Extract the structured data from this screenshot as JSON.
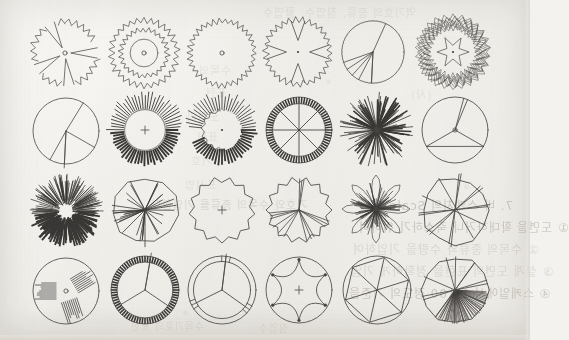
{
  "page": {
    "kind": "scanned-book-page",
    "background_color": "#f1f0ec",
    "ink_color": "#4c4a49",
    "grid": {
      "columns": 6,
      "rows": 4,
      "count": 24
    }
  },
  "bleed_through_text": {
    "note": "faint mirrored show-through from reverse side of the sheet",
    "lines": [
      {
        "text": "역기호의 종류, 침엽수, 활엽수",
        "x": 262,
        "y": 4,
        "size": 11,
        "dim": 3
      },
      {
        "text": "수목의",
        "x": 198,
        "y": 62,
        "size": 11,
        "dim": 3
      },
      {
        "text": "표현",
        "x": 205,
        "y": 84,
        "size": 11,
        "dim": 3
      },
      {
        "text": "(사)",
        "x": 410,
        "y": 86,
        "size": 11,
        "dim": 3
      },
      {
        "text": "도면의",
        "x": 186,
        "y": 108,
        "size": 11,
        "dim": 3
      },
      {
        "text": "표현",
        "x": 196,
        "y": 128,
        "size": 11,
        "dim": 3
      },
      {
        "text": "기호",
        "x": 190,
        "y": 152,
        "size": 11,
        "dim": 3
      },
      {
        "text": "표시법",
        "x": 184,
        "y": 176,
        "size": 11,
        "dim": 3
      },
      {
        "text": "기호와 수목의 종류를 기입한다",
        "x": 150,
        "y": 196,
        "size": 11,
        "dim": 2
      },
      {
        "text": "7. 바 스케치의 Scale",
        "x": 388,
        "y": 196,
        "size": 12,
        "dim": 1
      },
      {
        "text": "① 도면을 확대하거나 축소하기 위하여",
        "x": 358,
        "y": 218,
        "size": 12,
        "dim": 1
      },
      {
        "text": "② 수목의 종류와 수량을 기입하여",
        "x": 352,
        "y": 240,
        "size": 12,
        "dim": 2
      },
      {
        "text": "③ 설계 도면의 표현을 정확하게 기입",
        "x": 350,
        "y": 262,
        "size": 12,
        "dim": 2
      },
      {
        "text": "④ 스케일에서 1/100 정도의 기준을",
        "x": 348,
        "y": 284,
        "size": 12,
        "dim": 1
      },
      {
        "text": "한다.",
        "x": 438,
        "y": 306,
        "size": 12,
        "dim": 2
      },
      {
        "text": "수목기호의 표현",
        "x": 130,
        "y": 318,
        "size": 10,
        "dim": 3
      },
      {
        "text": "침엽수",
        "x": 258,
        "y": 320,
        "size": 10,
        "dim": 3
      }
    ]
  },
  "symbols": [
    {
      "id": "r1c1",
      "name": "spiky-crown-with-radial-gaps",
      "row": 1,
      "col": 1,
      "cx": 65,
      "cy": 53,
      "r": 32,
      "style": "jagged-outline-wedge-cutouts",
      "center_marker": "small-circle"
    },
    {
      "id": "r1c2",
      "name": "double-ring-jagged-crown",
      "row": 1,
      "col": 2,
      "cx": 144,
      "cy": 53,
      "r": 33,
      "style": "double-jagged-ring",
      "center_marker": "small-circle"
    },
    {
      "id": "r1c3",
      "name": "fine-serrated-crown",
      "row": 1,
      "col": 3,
      "cx": 222,
      "cy": 53,
      "r": 32,
      "style": "single-serrated-ring",
      "center_marker": "small-circle"
    },
    {
      "id": "r1c4",
      "name": "lobed-star-crown",
      "row": 1,
      "col": 4,
      "cx": 298,
      "cy": 52,
      "r": 32,
      "style": "jagged-outline-with-notches",
      "center_marker": "dot"
    },
    {
      "id": "r1c5",
      "name": "plain-circle-three-wedges",
      "row": 1,
      "col": 5,
      "cx": 373,
      "cy": 52,
      "r": 31,
      "style": "circle-with-pie-segments",
      "center_marker": "none"
    },
    {
      "id": "r1c6",
      "name": "dense-zigzag-wreath-crown",
      "row": 1,
      "col": 6,
      "cx": 453,
      "cy": 52,
      "r": 35,
      "style": "dense-double-zigzag",
      "center_marker": "dot"
    },
    {
      "id": "r2c1",
      "name": "plain-circle-three-branch",
      "row": 2,
      "col": 1,
      "cx": 66,
      "cy": 131,
      "r": 33,
      "style": "circle-three-radial-lines",
      "center_marker": "none"
    },
    {
      "id": "r2c2",
      "name": "tick-ring-crown-plus",
      "row": 2,
      "col": 2,
      "cx": 145,
      "cy": 130,
      "r": 34,
      "style": "radial-tick-ring",
      "center_marker": "plus"
    },
    {
      "id": "r2c3",
      "name": "broken-tick-ring-crown",
      "row": 2,
      "col": 3,
      "cx": 222,
      "cy": 130,
      "r": 34,
      "style": "broken-radial-tick-ring",
      "center_marker": "dot"
    },
    {
      "id": "r2c4",
      "name": "hatched-wheel-eight-spokes",
      "row": 2,
      "col": 4,
      "cx": 299,
      "cy": 130,
      "r": 33,
      "style": "hatched-rim-wheel",
      "center_marker": "dot"
    },
    {
      "id": "r2c5",
      "name": "radial-burst-starburst",
      "row": 2,
      "col": 5,
      "cx": 377,
      "cy": 130,
      "r": 36,
      "style": "long-needle-burst",
      "center_marker": "dot"
    },
    {
      "id": "r2c6",
      "name": "circle-three-spoke-outline",
      "row": 2,
      "col": 6,
      "cx": 455,
      "cy": 130,
      "r": 33,
      "style": "circle-three-spoke",
      "center_marker": "small-circle"
    },
    {
      "id": "r3c1",
      "name": "fine-needle-burst-crown",
      "row": 3,
      "col": 1,
      "cx": 66,
      "cy": 211,
      "r": 35,
      "style": "fine-needle-burst",
      "center_marker": "none"
    },
    {
      "id": "r3c2",
      "name": "polygon-crown-dense-spokes",
      "row": 3,
      "col": 2,
      "cx": 145,
      "cy": 210,
      "r": 34,
      "style": "polygon-with-radial-spokes",
      "center_marker": "dot"
    },
    {
      "id": "r3c3",
      "name": "scalloped-polygon-plus",
      "row": 3,
      "col": 3,
      "cx": 222,
      "cy": 210,
      "r": 33,
      "style": "scalloped-outline",
      "center_marker": "plus"
    },
    {
      "id": "r3c4",
      "name": "scalloped-crown-wedge-gaps",
      "row": 3,
      "col": 4,
      "cx": 299,
      "cy": 210,
      "r": 33,
      "style": "scalloped-with-wedge-gaps",
      "center_marker": "none"
    },
    {
      "id": "r3c5",
      "name": "dense-petal-starburst",
      "row": 3,
      "col": 5,
      "cx": 376,
      "cy": 209,
      "r": 34,
      "style": "petal-burst",
      "center_marker": "dot"
    },
    {
      "id": "r3c6",
      "name": "polygon-crown-crossing-lines",
      "row": 3,
      "col": 6,
      "cx": 455,
      "cy": 210,
      "r": 35,
      "style": "polygon-crossing-branches",
      "center_marker": "none"
    },
    {
      "id": "r4c1",
      "name": "circle-three-comb-tufts",
      "row": 4,
      "col": 1,
      "cx": 66,
      "cy": 291,
      "r": 33,
      "style": "circle-with-comb-tufts",
      "center_marker": "small-circle"
    },
    {
      "id": "r4c2",
      "name": "hatched-rim-three-segment",
      "row": 4,
      "col": 2,
      "cx": 145,
      "cy": 290,
      "r": 34,
      "style": "hatched-rim-three-segment",
      "center_marker": "none"
    },
    {
      "id": "r4c3",
      "name": "double-ring-three-segment",
      "row": 4,
      "col": 3,
      "cx": 222,
      "cy": 290,
      "r": 34,
      "style": "double-ring-three-segment",
      "center_marker": "none"
    },
    {
      "id": "r4c4",
      "name": "wavy-star-inside-circle",
      "row": 4,
      "col": 4,
      "cx": 299,
      "cy": 290,
      "r": 33,
      "style": "wavy-star-in-circle",
      "center_marker": "plus"
    },
    {
      "id": "r4c5",
      "name": "hexagon-in-circle-six-spokes",
      "row": 4,
      "col": 5,
      "cx": 377,
      "cy": 290,
      "r": 34,
      "style": "hexagon-in-circle",
      "center_marker": "none"
    },
    {
      "id": "r4c6",
      "name": "polygon-crown-half-hatched",
      "row": 4,
      "col": 6,
      "cx": 455,
      "cy": 290,
      "r": 35,
      "style": "polygon-half-hatched",
      "center_marker": "none"
    }
  ]
}
